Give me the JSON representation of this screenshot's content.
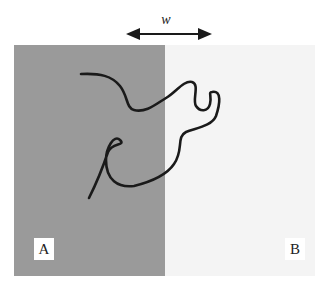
{
  "diagram": {
    "width_label": "w",
    "region_a": {
      "label": "A",
      "color": "#9a9a9a"
    },
    "region_b": {
      "label": "B",
      "color": "#f4f4f4"
    },
    "curve_color": "#1a1a1a",
    "arrow_color": "#1a1a1a"
  }
}
